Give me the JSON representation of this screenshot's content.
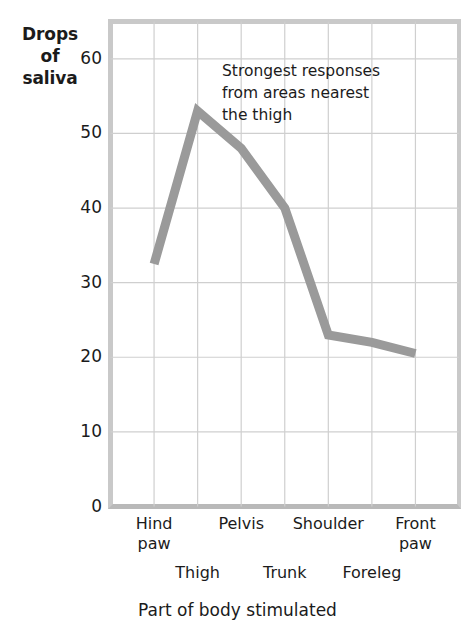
{
  "chart_data": {
    "type": "line",
    "title": "",
    "xlabel": "Part of body stimulated",
    "ylabel": "Drops of saliva",
    "ylabel_lines": [
      "Drops",
      "of",
      "saliva"
    ],
    "categories": [
      "Hind paw",
      "Thigh",
      "Pelvis",
      "Trunk",
      "Shoulder",
      "Foreleg",
      "Front paw"
    ],
    "values": [
      32.5,
      53,
      48,
      40,
      23,
      22,
      20.5
    ],
    "series": [
      {
        "name": "Drops of saliva",
        "values": [
          32.5,
          53,
          48,
          40,
          23,
          22,
          20.5
        ]
      }
    ],
    "yticks": [
      0,
      10,
      20,
      30,
      40,
      50,
      60
    ],
    "ylim": [
      0,
      65
    ],
    "xlim": [
      -1,
      7
    ],
    "grid": true,
    "legend": "none",
    "line_color": "#9a9a9a",
    "grid_color": "#cfcfcf",
    "frame_color": "#c9c9c9",
    "annotations": [
      {
        "text_lines": [
          "Strongest responses",
          "from areas nearest",
          "the thigh"
        ],
        "x": 222,
        "y": 60
      }
    ]
  },
  "axis": {
    "y_title_lines": [
      "Drops",
      "of",
      "saliva"
    ],
    "y_ticks": [
      "60",
      "50",
      "40",
      "30",
      "20",
      "10",
      "0"
    ],
    "x_title": "Part of body stimulated",
    "x_ticks_top_row": [
      "Hind paw",
      "Pelvis",
      "Shoulder",
      "Front paw"
    ],
    "x_ticks_bottom_row": [
      "Thigh",
      "Trunk",
      "Foreleg"
    ],
    "x_tick_hind_paw_l1": "Hind",
    "x_tick_hind_paw_l2": "paw",
    "x_tick_pelvis": "Pelvis",
    "x_tick_shoulder": "Shoulder",
    "x_tick_front_paw_l1": "Front",
    "x_tick_front_paw_l2": "paw",
    "x_tick_thigh": "Thigh",
    "x_tick_trunk": "Trunk",
    "x_tick_foreleg": "Foreleg"
  },
  "annotation": {
    "line1": "Strongest responses",
    "line2": "from areas nearest",
    "line3": "the thigh"
  }
}
